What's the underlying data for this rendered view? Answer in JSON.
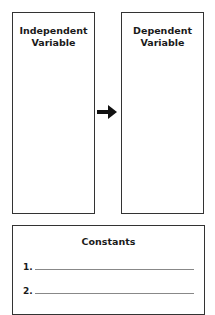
{
  "diagram": {
    "independent_box": {
      "title_line1": "Independent",
      "title_line2": "Variable"
    },
    "dependent_box": {
      "title_line1": "Dependent",
      "title_line2": "Variable"
    },
    "arrow": {
      "icon": "right-arrow-icon",
      "direction": "independent-to-dependent"
    },
    "constants_box": {
      "title": "Constants",
      "items": [
        {
          "number": "1."
        },
        {
          "number": "2."
        }
      ]
    }
  }
}
